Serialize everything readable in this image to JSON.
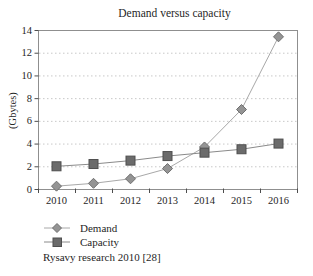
{
  "figure": {
    "title": "Demand versus capacity",
    "y_axis_label": "(Gbytes)",
    "source_note": "Rysavy research 2010 [28]"
  },
  "chart_data": {
    "type": "line",
    "title": "Demand versus capacity",
    "xlabel": "",
    "ylabel": "(Gbytes)",
    "categories": [
      "2010",
      "2011",
      "2012",
      "2013",
      "2014",
      "2015",
      "2016"
    ],
    "series": [
      {
        "name": "Demand",
        "marker": "diamond",
        "color": "#949494",
        "edge_color": "#6f6f6f",
        "line_color": "#a8a8a8",
        "values": [
          0.25,
          0.5,
          0.9,
          1.8,
          3.7,
          7.0,
          13.4
        ]
      },
      {
        "name": "Capacity",
        "marker": "square",
        "color": "#6b6b6b",
        "edge_color": "#4f4f4f",
        "line_color": "#8a8a8a",
        "values": [
          2.0,
          2.2,
          2.5,
          2.9,
          3.2,
          3.5,
          4.0
        ]
      }
    ],
    "ylim": [
      0,
      14
    ],
    "ytick_step": 2,
    "grid": "horizontal-dotted",
    "legend_position": "bottom-left",
    "source_note": "Rysavy research 2010 [28]"
  },
  "colors": {
    "background": "#ffffff",
    "grid": "#c8c8c8",
    "border": "#8f8f8f",
    "axis": "#4d4d4d",
    "text": "#262626"
  }
}
